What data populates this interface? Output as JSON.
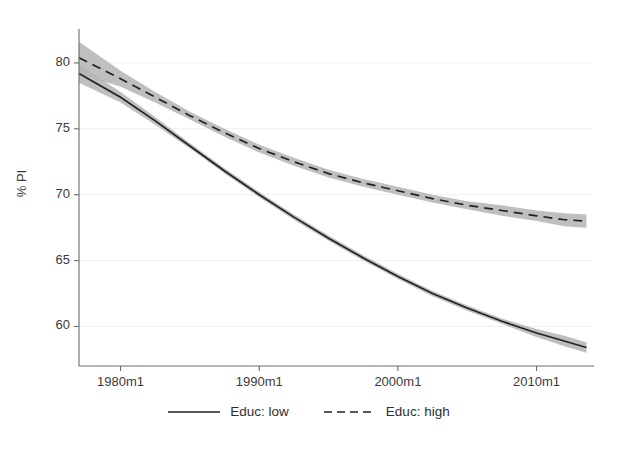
{
  "chart_data": {
    "type": "line",
    "title": "",
    "xlabel": "",
    "ylabel": "% PI",
    "xlim": [
      1977.0,
      2014.0
    ],
    "ylim": [
      57.0,
      82.5
    ],
    "xticks": [
      1980,
      1990,
      2000,
      2010
    ],
    "xtick_labels": [
      "1980m1",
      "1990m1",
      "2000m1",
      "2010m1"
    ],
    "yticks": [
      60,
      65,
      70,
      75,
      80
    ],
    "ytick_labels": [
      "60",
      "65",
      "70",
      "75",
      "80"
    ],
    "grid": "horizontal-faint",
    "legend_position": "bottom-center",
    "band_type": "confidence-interval",
    "band_color": "#b4b4b4",
    "line_color": "#222222",
    "background": "#ffffff",
    "x": [
      1977.0,
      1980.0,
      1982.5,
      1985.0,
      1987.5,
      1990.0,
      1992.5,
      1995.0,
      1997.5,
      2000.0,
      2002.5,
      2005.0,
      2007.5,
      2010.0,
      2012.0,
      2013.6
    ],
    "series": [
      {
        "name": "Educ: low",
        "style": "solid",
        "values": [
          79.2,
          77.4,
          75.6,
          73.7,
          71.8,
          70.0,
          68.3,
          66.7,
          65.2,
          63.8,
          62.5,
          61.4,
          60.4,
          59.5,
          58.9,
          58.4
        ],
        "ci_lower": [
          78.5,
          77.0,
          75.3,
          73.5,
          71.6,
          69.8,
          68.1,
          66.5,
          65.0,
          63.6,
          62.3,
          61.2,
          60.2,
          59.2,
          58.5,
          58.0
        ],
        "ci_upper": [
          79.9,
          77.8,
          75.9,
          73.9,
          72.0,
          70.2,
          68.5,
          66.9,
          65.4,
          64.0,
          62.7,
          61.6,
          60.6,
          59.8,
          59.3,
          58.8
        ]
      },
      {
        "name": "Educ: high",
        "style": "dashed",
        "values": [
          80.4,
          78.8,
          77.4,
          76.0,
          74.7,
          73.5,
          72.5,
          71.6,
          70.9,
          70.3,
          69.7,
          69.2,
          68.8,
          68.4,
          68.1,
          68.0
        ],
        "ci_lower": [
          79.2,
          78.2,
          77.0,
          75.7,
          74.4,
          73.2,
          72.2,
          71.3,
          70.6,
          70.0,
          69.4,
          68.9,
          68.4,
          68.0,
          67.6,
          67.5
        ],
        "ci_upper": [
          81.6,
          79.4,
          77.8,
          76.3,
          75.0,
          73.8,
          72.8,
          71.9,
          71.2,
          70.6,
          70.0,
          69.5,
          69.2,
          68.8,
          68.6,
          68.5
        ]
      }
    ]
  },
  "axis": {
    "y_title": "% PI"
  },
  "legend": {
    "items": [
      {
        "label": "Educ: low",
        "style": "solid"
      },
      {
        "label": "Educ: high",
        "style": "dashed"
      }
    ]
  }
}
